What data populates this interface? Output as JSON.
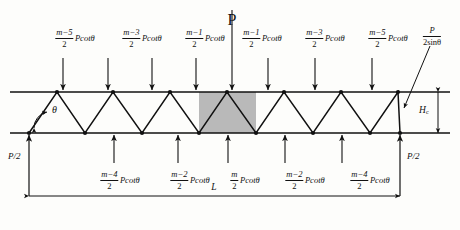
{
  "figure": {
    "type": "structural-truss-load-diagram",
    "ink_color": "#111111",
    "shade_color": "#b9b9b9"
  },
  "geometry": {
    "span_label": "L",
    "depth_label": "H",
    "depth_subscript": "c",
    "angle_label": "θ",
    "top_chord_y": 92,
    "bottom_chord_y": 133,
    "left_node_x": 29,
    "right_node_x": 400,
    "panel_half": 28.4,
    "top_nodes_x": [
      57,
      113,
      170,
      227,
      284,
      341,
      398
    ],
    "bottom_nodes_x": [
      29,
      85,
      142,
      199,
      256,
      313,
      370,
      400
    ],
    "shaded_panel": {
      "x": 199,
      "width": 57
    }
  },
  "loads": {
    "center": {
      "label": "P",
      "x": 232,
      "arrow_top": 8,
      "arrow_tip": 92
    },
    "top": [
      {
        "id": "t1",
        "num": "m−5",
        "den": "2",
        "unit": "Pcotθ",
        "label_x": 75,
        "arrow_x": 63,
        "arrow_top": 58
      },
      {
        "id": "t2",
        "num": "m−3",
        "den": "2",
        "unit": "Pcotθ",
        "label_x": 142,
        "arrow_x": 108,
        "arrow_top": 58
      },
      {
        "id": "t3",
        "num": "m−1",
        "den": "2",
        "unit": "Pcotθ",
        "label_x": 205,
        "arrow_x": 152,
        "arrow_top": 58
      },
      {
        "id": "t4",
        "num": "m−1",
        "den": "2",
        "unit": "Pcotθ",
        "label_x": 262,
        "arrow_x": 196,
        "arrow_top": 58
      },
      {
        "id": "t5",
        "num": "m−3",
        "den": "2",
        "unit": "Pcotθ",
        "label_x": 325,
        "arrow_x": 268,
        "arrow_top": 58
      },
      {
        "id": "t6",
        "num": "m−5",
        "den": "2",
        "unit": "Pcotθ",
        "label_x": 388,
        "arrow_x": 315,
        "arrow_top": 58
      },
      {
        "id": "t7",
        "num": "",
        "den": "",
        "unit": "",
        "label_x": 0,
        "arrow_x": 372,
        "arrow_top": 58
      }
    ],
    "bottom": [
      {
        "id": "b1",
        "num": "m−4",
        "den": "2",
        "unit": "Pcotθ",
        "label_x": 120,
        "arrow_x": 114,
        "arrow_bottom": 133
      },
      {
        "id": "b2",
        "num": "m−2",
        "den": "2",
        "unit": "Pcotθ",
        "label_x": 190,
        "arrow_x": 178,
        "arrow_bottom": 133
      },
      {
        "id": "b3",
        "num": "m",
        "den": "2",
        "unit": "Pcotθ",
        "label_x": 245,
        "arrow_x": 228,
        "arrow_bottom": 133
      },
      {
        "id": "b4",
        "num": "m−2",
        "den": "2",
        "unit": "Pcotθ",
        "label_x": 305,
        "arrow_x": 285,
        "arrow_bottom": 133
      },
      {
        "id": "b5",
        "num": "m−4",
        "den": "2",
        "unit": "Pcotθ",
        "label_x": 370,
        "arrow_x": 342,
        "arrow_bottom": 133
      }
    ],
    "diagonal_force": {
      "num": "P",
      "den": "2sinθ",
      "label_x": 428,
      "label_y": 26
    },
    "reactions": [
      {
        "id": "left",
        "label": "P/2",
        "x": 16,
        "y": 152
      },
      {
        "id": "right",
        "label": "P/2",
        "x": 412,
        "y": 152
      }
    ]
  }
}
